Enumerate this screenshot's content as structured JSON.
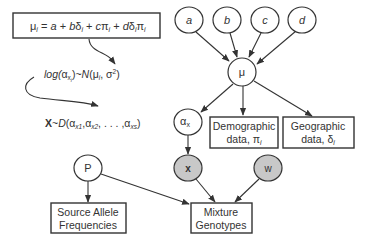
{
  "equation_box": {
    "mu": "μ",
    "sub_i": "i",
    "eq": " = ",
    "a": "a",
    "plus1": " + ",
    "b": "b",
    "delta": "δ",
    "plus2": " + ",
    "c": "c",
    "pi": "π",
    "plus3": " + ",
    "d": "d"
  },
  "formulas": {
    "log_line": {
      "log": "log(",
      "alpha": "α",
      "sub_x": "x",
      "sub_i": "i",
      "mid": ")~",
      "N": "N",
      "args": "(μ",
      "args_sub": "i",
      "args_end": ", σ",
      "sup2": "2",
      "close": ")"
    },
    "dirichlet_line": {
      "X": "X",
      "tilde": "~",
      "D": "D",
      "open": "(",
      "alpha": "α",
      "sub1": "x1",
      "sub2": "x2",
      "dots": ", . . . ,",
      "subs": "xs",
      "close": ")"
    }
  },
  "nodes": {
    "a": {
      "label": "a",
      "shaded": false
    },
    "b": {
      "label": "b",
      "shaded": false
    },
    "c": {
      "label": "c",
      "shaded": false
    },
    "d": {
      "label": "d",
      "shaded": false
    },
    "mu": {
      "label": "μ",
      "shaded": false
    },
    "alpha_x": {
      "label": "α",
      "sub": "x",
      "shaded": false
    },
    "x": {
      "label": "x",
      "shaded": true
    },
    "w": {
      "label": "w",
      "shaded": true
    },
    "P": {
      "label": "P",
      "shaded": false
    }
  },
  "boxes": {
    "demographic": {
      "line1": "Demographic",
      "line2": "data, π",
      "sub": "i"
    },
    "geographic": {
      "line1": "Geographic",
      "line2": "data, δ",
      "sub": "i"
    },
    "source_allele": {
      "line1": "Source Allele",
      "line2": "Frequencies"
    },
    "mixture": {
      "line1": "Mixture",
      "line2": "Genotypes"
    }
  },
  "colors": {
    "shaded_node": "#c8c8c8",
    "stroke": "#333333",
    "background": "#ffffff"
  }
}
